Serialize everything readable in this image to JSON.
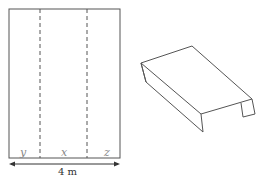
{
  "diagram": {
    "flat_sheet": {
      "sections": [
        {
          "label": "y"
        },
        {
          "label": "x"
        },
        {
          "label": "z"
        }
      ],
      "fold_lines": 2,
      "width_label": "4 m"
    },
    "folded_shape": {
      "description": "Sheet folded along the dashed lines into a U-shaped channel (inverted)"
    },
    "colors": {
      "line": "#555555",
      "dashed": "#555555",
      "handwriting": "#888888"
    }
  }
}
